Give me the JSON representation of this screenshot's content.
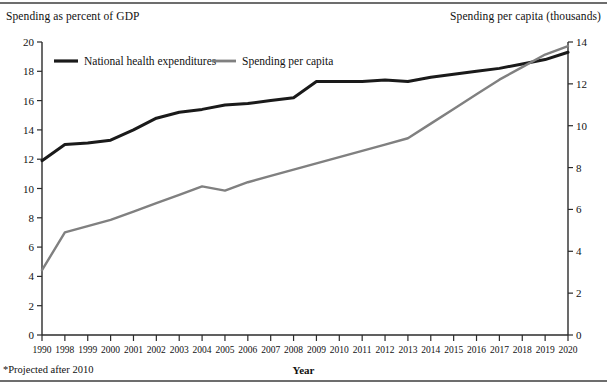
{
  "left_axis_title": "Spending as percent of GDP",
  "right_axis_title": "Spending per capita (thousands)",
  "x_axis_title": "Year",
  "footnote": "*Projected after 2010",
  "colors": {
    "nhe_line": "#1a1a1a",
    "percapita_line": "#808080",
    "axis": "#2b2b2b",
    "rule": "#6d6d6d",
    "background": "#ffffff"
  },
  "legend": [
    {
      "label": "National health expenditures",
      "color": "#1a1a1a",
      "series": "nhe"
    },
    {
      "label": "Spending per capita",
      "color": "#808080",
      "series": "percapita"
    }
  ],
  "chart_data": {
    "type": "line",
    "title": "",
    "xlabel": "Year",
    "grid": false,
    "legend_position": "top-left-inside",
    "categories": [
      "1990",
      "1998",
      "1999",
      "2000",
      "2001",
      "2002",
      "2003",
      "2004",
      "2005",
      "2006",
      "2007",
      "2008",
      "2009",
      "2010",
      "2011",
      "2012",
      "2013",
      "2014",
      "2015",
      "2016",
      "2017",
      "2018",
      "2019",
      "2020"
    ],
    "left_axis": {
      "label": "Spending as percent of GDP",
      "ylim": [
        0,
        20
      ],
      "ticks": [
        0,
        2,
        4,
        6,
        8,
        10,
        12,
        14,
        16,
        18,
        20
      ]
    },
    "right_axis": {
      "label": "Spending per capita (thousands)",
      "ylim": [
        0,
        14
      ],
      "ticks": [
        0,
        2,
        4,
        6,
        8,
        10,
        12,
        14
      ]
    },
    "series": [
      {
        "name": "National health expenditures",
        "axis": "left",
        "unit": "percent of GDP",
        "color": "#1a1a1a",
        "values": [
          11.9,
          13.0,
          13.1,
          13.3,
          14.0,
          14.8,
          15.2,
          15.4,
          15.7,
          15.8,
          16.0,
          16.2,
          17.3,
          17.3,
          17.3,
          17.4,
          17.3,
          17.6,
          17.8,
          18.0,
          18.2,
          18.5,
          18.8,
          19.3
        ]
      },
      {
        "name": "Spending per capita",
        "axis": "right",
        "unit": "thousands of dollars",
        "color": "#808080",
        "values": [
          3.1,
          4.9,
          5.2,
          5.5,
          5.9,
          6.3,
          6.7,
          7.1,
          6.9,
          7.3,
          7.6,
          7.9,
          8.2,
          8.5,
          8.8,
          9.1,
          9.4,
          10.1,
          10.8,
          11.5,
          12.2,
          12.8,
          13.4,
          13.8
        ]
      }
    ]
  }
}
